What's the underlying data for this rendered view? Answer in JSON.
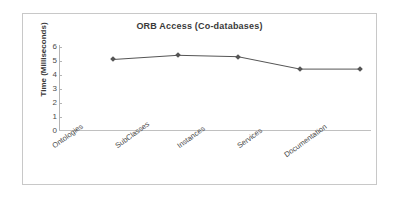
{
  "chart_data": {
    "type": "line",
    "title": "ORB Access (Co-databases)",
    "xlabel": "",
    "ylabel": "Time (Milliseconds)",
    "categories": [
      "Ontologies",
      "SubClasses",
      "Instances",
      "Services",
      "Documentation"
    ],
    "values": [
      5.1,
      5.4,
      5.3,
      4.4,
      4.4
    ],
    "series": [
      {
        "name": "Time (Milliseconds)",
        "values": [
          5.1,
          5.4,
          5.3,
          4.4,
          4.4
        ]
      }
    ],
    "ylim": [
      0,
      6
    ],
    "yticks": [
      0,
      1,
      2,
      3,
      4,
      5,
      6
    ],
    "ytick_labels": [
      "0",
      "1",
      "2",
      "3",
      "4",
      "5",
      "6"
    ],
    "grid": false,
    "legend": "none",
    "marker": "diamond",
    "line_color": "#555555",
    "marker_color": "#555555",
    "frame_color": "#c8c8c8",
    "text_color": "#3a3a3a",
    "background": "#ffffff"
  }
}
